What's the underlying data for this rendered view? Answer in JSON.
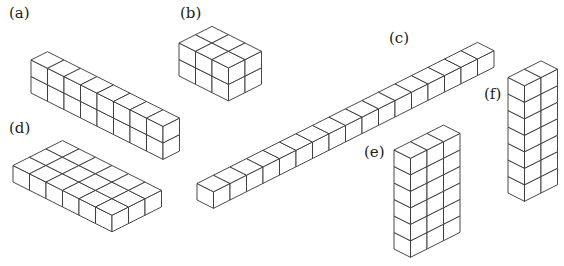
{
  "figure": {
    "background": "#ffffff",
    "stroke_color": "#333333",
    "face_color": "#ffffff",
    "unit": {
      "a": [
        16.5,
        8.3
      ],
      "b": [
        16.5,
        -8.3
      ],
      "h": 16.5
    },
    "groups": [
      {
        "id": "a",
        "label": "(a)",
        "label_pos": [
          9,
          6
        ],
        "dims": {
          "along_a": 8,
          "along_b": 1,
          "height": 2
        },
        "origin": [
          31,
          93
        ]
      },
      {
        "id": "b",
        "label": "(b)",
        "label_pos": [
          180,
          6
        ],
        "dims": {
          "along_a": 3,
          "along_b": 2,
          "height": 2
        },
        "origin": [
          179,
          76
        ]
      },
      {
        "id": "c",
        "label": "(c)",
        "label_pos": [
          389,
          31
        ],
        "dims": {
          "along_a": 1,
          "along_b": 17,
          "height": 1
        },
        "origin": [
          197,
          200
        ]
      },
      {
        "id": "d",
        "label": "(d)",
        "label_pos": [
          9,
          121
        ],
        "dims": {
          "along_a": 6,
          "along_b": 3,
          "height": 1
        },
        "origin": [
          13,
          182
        ]
      },
      {
        "id": "e",
        "label": "(e)",
        "label_pos": [
          364,
          145
        ],
        "dims": {
          "along_a": 1,
          "along_b": 3,
          "height": 6
        },
        "origin": [
          394,
          249
        ]
      },
      {
        "id": "f",
        "label": "(f)",
        "label_pos": [
          484,
          87
        ],
        "dims": {
          "along_a": 1,
          "along_b": 2,
          "height": 7
        },
        "origin": [
          508,
          193
        ]
      }
    ]
  }
}
